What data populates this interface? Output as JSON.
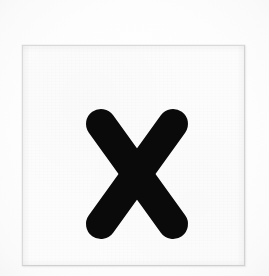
{
  "image": {
    "kind": "scanned-letter-card",
    "width": 269,
    "height": 276,
    "background_color": "#fdfdfd",
    "alt_text": "Scanned square white paper card printed with a bold lowercase letter x"
  },
  "card": {
    "label": "letter card",
    "paper_color": "#fcfcfc",
    "border_color": "#d6d6d6",
    "left": 22,
    "top": 45,
    "width": 223,
    "height": 221
  },
  "glyph": {
    "character": "x",
    "name": "lowercase-letter-x",
    "case": "lowercase",
    "ink_color": "#0a0a0a",
    "stroke_cap": "round",
    "stroke_width": 30,
    "left": 88,
    "top": 111,
    "width": 98,
    "height": 126,
    "strokes": [
      {
        "name": "stroke-down-right",
        "x1": 15,
        "y1": 15,
        "x2": 87,
        "y2": 115
      },
      {
        "name": "stroke-down-left",
        "x1": 87,
        "y1": 15,
        "x2": 15,
        "y2": 115
      }
    ]
  }
}
